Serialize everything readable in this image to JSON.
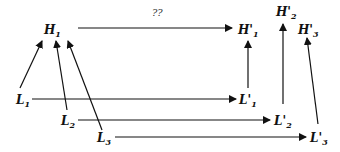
{
  "diagram": {
    "nodes": {
      "H1": {
        "base": "H",
        "prime": "",
        "sub": "1"
      },
      "H1p": {
        "base": "H",
        "prime": "'",
        "sub": "1"
      },
      "H2p": {
        "base": "H",
        "prime": "'",
        "sub": "2"
      },
      "H3p": {
        "base": "H",
        "prime": "'",
        "sub": "3"
      },
      "L1": {
        "base": "L",
        "prime": "",
        "sub": "1"
      },
      "L2": {
        "base": "L",
        "prime": "",
        "sub": "2"
      },
      "L3": {
        "base": "L",
        "prime": "",
        "sub": "3"
      },
      "L1p": {
        "base": "L",
        "prime": "'",
        "sub": "1"
      },
      "L2p": {
        "base": "L",
        "prime": "'",
        "sub": "2"
      },
      "L3p": {
        "base": "L",
        "prime": "'",
        "sub": "3"
      }
    },
    "unknown_mapping_label": "??",
    "edges": [
      {
        "from": "H1",
        "to": "H1p",
        "label": "??"
      },
      {
        "from": "L1",
        "to": "H1"
      },
      {
        "from": "L2",
        "to": "H1"
      },
      {
        "from": "L3",
        "to": "H1"
      },
      {
        "from": "L1",
        "to": "L1p"
      },
      {
        "from": "L2",
        "to": "L2p"
      },
      {
        "from": "L3",
        "to": "L3p"
      },
      {
        "from": "L1p",
        "to": "H1p"
      },
      {
        "from": "L2p",
        "to": "H2p"
      },
      {
        "from": "L3p",
        "to": "H3p"
      }
    ]
  }
}
